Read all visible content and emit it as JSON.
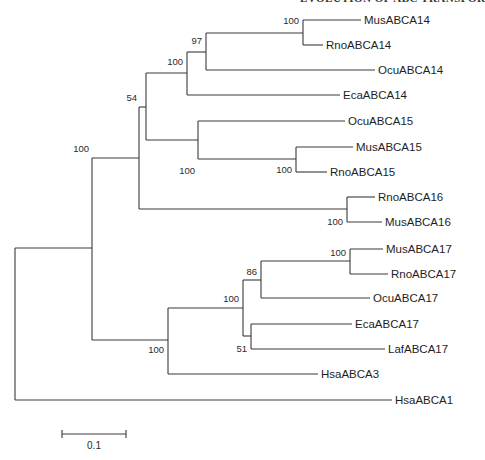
{
  "header": {
    "running_title": "EVOLUTION OF ABC TRANSPORTERS"
  },
  "tree": {
    "type": "phylogenetic-tree",
    "line_color": "#3a3a3a",
    "taxa": [
      {
        "label": "MusABCA14",
        "y": 20,
        "x_end": 361
      },
      {
        "label": "RnoABCA14",
        "y": 45,
        "x_end": 323
      },
      {
        "label": "OcuABCA14",
        "y": 70,
        "x_end": 375
      },
      {
        "label": "EcaABCA14",
        "y": 95,
        "x_end": 340
      },
      {
        "label": "OcuABCA15",
        "y": 121,
        "x_end": 345
      },
      {
        "label": "MusABCA15",
        "y": 147,
        "x_end": 353
      },
      {
        "label": "RnoABCA15",
        "y": 172,
        "x_end": 327
      },
      {
        "label": "RnoABCA16",
        "y": 197,
        "x_end": 375
      },
      {
        "label": "MusABCA16",
        "y": 222,
        "x_end": 382
      },
      {
        "label": "MusABCA17",
        "y": 249,
        "x_end": 383
      },
      {
        "label": "RnoABCA17",
        "y": 274,
        "x_end": 388
      },
      {
        "label": "OcuABCA17",
        "y": 298,
        "x_end": 370
      },
      {
        "label": "EcaABCA17",
        "y": 324,
        "x_end": 352
      },
      {
        "label": "LafABCA17",
        "y": 349,
        "x_end": 385
      },
      {
        "label": "HsaABCA3",
        "y": 374,
        "x_end": 318
      },
      {
        "label": "HsaABCA1",
        "y": 400,
        "x_end": 392
      }
    ],
    "bootstrap": [
      {
        "value": "100",
        "x": 299,
        "y": 24
      },
      {
        "value": "97",
        "x": 202,
        "y": 44
      },
      {
        "value": "100",
        "x": 183,
        "y": 65
      },
      {
        "value": "54",
        "x": 132,
        "y": 98
      },
      {
        "value": "100",
        "x": 292,
        "y": 172
      },
      {
        "value": "100",
        "x": 184,
        "y": 173
      },
      {
        "value": "100",
        "x": 107,
        "y": 152
      },
      {
        "value": "100",
        "x": 343,
        "y": 222
      },
      {
        "value": "100",
        "x": 346,
        "y": 256
      },
      {
        "value": "86",
        "x": 257,
        "y": 274
      },
      {
        "value": "100",
        "x": 239,
        "y": 301
      },
      {
        "value": "51",
        "x": 247,
        "y": 352
      },
      {
        "value": "100",
        "x": 164,
        "y": 350
      }
    ],
    "scale_bar": {
      "label": "0.1",
      "x1": 62,
      "x2": 126,
      "y": 434
    }
  }
}
